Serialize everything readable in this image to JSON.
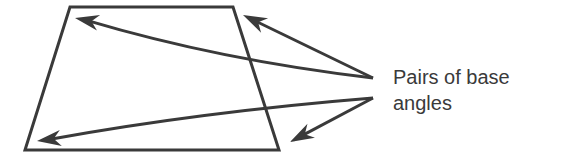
{
  "figure": {
    "label_lines": [
      "Pairs of base",
      "angles"
    ],
    "stroke_color": "#3a3a3a",
    "trapezoid": {
      "points": "70,7 233,7 279,150 25,150"
    },
    "arrows": [
      {
        "name": "arrow-to-top-left-angle",
        "from": [
          373,
          78
        ],
        "to": [
          75,
          18
        ],
        "curve": [
          220,
          60
        ]
      },
      {
        "name": "arrow-to-top-right-angle",
        "from": [
          373,
          78
        ],
        "to": [
          243,
          15
        ],
        "curve": null
      },
      {
        "name": "arrow-to-bottom-left-angle",
        "from": [
          373,
          98
        ],
        "to": [
          37,
          141
        ],
        "curve": [
          200,
          112
        ]
      },
      {
        "name": "arrow-to-bottom-right-angle",
        "from": [
          373,
          98
        ],
        "to": [
          290,
          142
        ],
        "curve": null
      }
    ]
  }
}
